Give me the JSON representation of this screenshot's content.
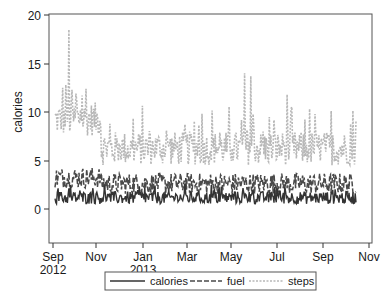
{
  "chart_data": {
    "type": "line",
    "title": "",
    "xlabel": "",
    "ylabel": "calories",
    "ylim": [
      0,
      20
    ],
    "yticks": [
      0,
      5,
      10,
      15,
      20
    ],
    "xticks": [
      {
        "label": "Sep",
        "sub": "2012"
      },
      {
        "label": "Nov",
        "sub": ""
      },
      {
        "label": "Jan",
        "sub": "2013"
      },
      {
        "label": "Mar",
        "sub": ""
      },
      {
        "label": "May",
        "sub": ""
      },
      {
        "label": "Jul",
        "sub": ""
      },
      {
        "label": "Sep",
        "sub": ""
      },
      {
        "label": "Nov",
        "sub": ""
      }
    ],
    "x_range": [
      "2012-09-01",
      "2013-11-01"
    ],
    "grid": false,
    "legend_position": "bottom",
    "series": [
      {
        "name": "calories",
        "style": "solid",
        "color": "#3a3a3a",
        "approx_mean": 1.2,
        "approx_range": [
          0.3,
          2.5
        ]
      },
      {
        "name": "fuel",
        "style": "dashed",
        "color": "#4a4a4a",
        "approx_mean": 2.8,
        "approx_range": [
          1.0,
          4.5
        ]
      },
      {
        "name": "steps",
        "style": "dotted",
        "color": "#b5b5b5",
        "approx_mean": 5.5,
        "approx_range": [
          2.0,
          18.5
        ]
      }
    ]
  },
  "legend": {
    "items": [
      {
        "label": "calories"
      },
      {
        "label": "fuel"
      },
      {
        "label": "steps"
      }
    ]
  },
  "axis": {
    "ylabel": "calories",
    "yticks": [
      "0",
      "5",
      "10",
      "15",
      "20"
    ],
    "xticks": [
      "Sep",
      "Nov",
      "Jan",
      "Mar",
      "May",
      "Jul",
      "Sep",
      "Nov"
    ],
    "xsub": [
      "2012",
      "",
      "2013",
      "",
      "",
      "",
      "",
      ""
    ]
  }
}
